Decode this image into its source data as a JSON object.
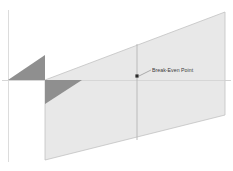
{
  "diagram": {
    "background_color": "#ffffff",
    "annotation": {
      "label": "Break-Even Point",
      "marker_shape": "square",
      "marker_color": "#2b2b2b",
      "leader_line_color": "#8c8c8c",
      "marker_x": 137,
      "marker_y": 76
    },
    "axes": {
      "vertical_axis_color": "#d9d9d9",
      "horizontal_axis_color": "#d4d4d4",
      "vertical_axis_x": 8,
      "horizontal_axis_y": 80
    },
    "regions": [
      {
        "name": "loss-region-upper",
        "fill": "#8f8f8f",
        "shape": "triangle",
        "points": "8,80 45,80 45,55"
      },
      {
        "name": "loss-region-lower",
        "fill": "#8f8f8f",
        "shape": "triangle",
        "points": "45,80 82,80 45,104"
      },
      {
        "name": "profit-region",
        "fill": "#e8e8e8",
        "stroke": "#bdbdbd",
        "shape": "parallelogram",
        "points": "45,80 225,12 225,115 45,160"
      }
    ],
    "divider": {
      "name": "interior-divider",
      "color": "#b5b5b5",
      "x": 137,
      "y_top": 44,
      "y_bottom": 140
    }
  }
}
